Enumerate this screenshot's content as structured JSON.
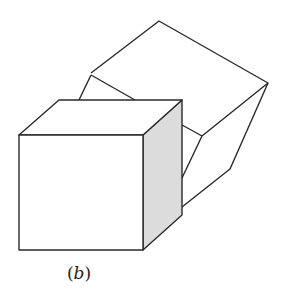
{
  "figure": {
    "caption": "(b)",
    "caption_prefix": "(",
    "caption_letter": "b",
    "caption_suffix": ")",
    "colors": {
      "stroke": "#2a2a2a",
      "shaded_face": "#dcdcdc",
      "background": "#ffffff"
    }
  }
}
